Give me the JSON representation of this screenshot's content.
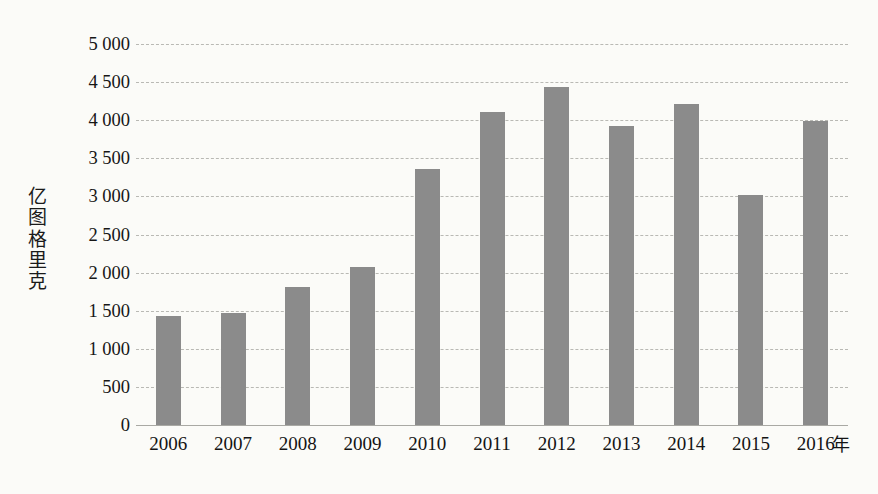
{
  "chart_data": {
    "type": "bar",
    "title": "",
    "xlabel": "年",
    "ylabel": "亿图格里克",
    "categories": [
      "2006",
      "2007",
      "2008",
      "2009",
      "2010",
      "2011",
      "2012",
      "2013",
      "2014",
      "2015",
      "2016"
    ],
    "values": [
      1430,
      1470,
      1810,
      2070,
      3360,
      4110,
      4430,
      3930,
      4210,
      3020,
      3990
    ],
    "ylim": [
      0,
      5000
    ],
    "ytick_labels": [
      "5 000",
      "4 500",
      "4 000",
      "3 500",
      "3 000",
      "2 500",
      "2 000",
      "1 500",
      "1 000",
      "500",
      "0"
    ],
    "ytick_values": [
      5000,
      4500,
      4000,
      3500,
      3000,
      2500,
      2000,
      1500,
      1000,
      500,
      0
    ],
    "grid": true,
    "legend": "none",
    "bar_color": "#8b8b8b",
    "gridline_color": "#b9b9b4",
    "background_color": "#fbfbf8"
  },
  "axis": {
    "y_title_chars": "亿\n图\n格\n里\n克",
    "x_unit_label": "年"
  }
}
